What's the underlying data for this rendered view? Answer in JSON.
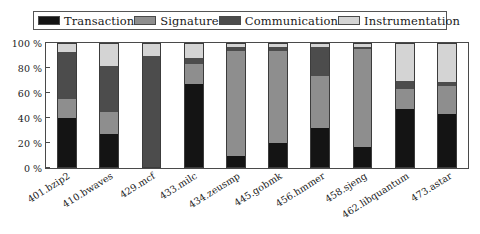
{
  "chart_data": {
    "type": "bar",
    "stacked": true,
    "normalized": true,
    "title": "",
    "xlabel": "",
    "ylabel": "",
    "ylim": [
      0,
      100
    ],
    "yticks": [
      0,
      20,
      40,
      60,
      80,
      100
    ],
    "ytick_labels": [
      "0 %",
      "20 %",
      "40 %",
      "60 %",
      "80 %",
      "100 %"
    ],
    "grid": false,
    "legend_position": "top",
    "categories": [
      "401.bzip2",
      "410.bwaves",
      "429.mcf",
      "433.milc",
      "434.zeusmp",
      "445.gobmk",
      "456.hmmer",
      "458.sjeng",
      "462.libquantum",
      "473.astar"
    ],
    "series": [
      {
        "name": "Transaction",
        "color": "#141414",
        "values": [
          40,
          27,
          0,
          67,
          10,
          20,
          32,
          17,
          47,
          43
        ]
      },
      {
        "name": "Signature",
        "color": "#8e8e8e",
        "values": [
          15,
          18,
          0,
          16,
          84,
          74,
          42,
          78,
          16,
          23
        ]
      },
      {
        "name": "Communication",
        "color": "#4c4c4c",
        "values": [
          38,
          37,
          90,
          5,
          3,
          3,
          23,
          2,
          7,
          3
        ]
      },
      {
        "name": "Instrumentation",
        "color": "#d4d4d4",
        "values": [
          7,
          18,
          10,
          12,
          3,
          3,
          3,
          3,
          30,
          31
        ]
      }
    ]
  },
  "legend": {
    "items": [
      {
        "label": "Transaction",
        "color": "#141414"
      },
      {
        "label": "Signature",
        "color": "#8e8e8e"
      },
      {
        "label": "Communication",
        "color": "#4c4c4c"
      },
      {
        "label": "Instrumentation",
        "color": "#d4d4d4"
      }
    ]
  }
}
